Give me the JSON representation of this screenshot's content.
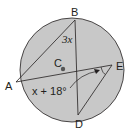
{
  "diagram": {
    "circle": {
      "cx": 72,
      "cy": 70,
      "r": 52,
      "fill": "#c8c8c8",
      "stroke": "#231f20"
    },
    "points": {
      "A": {
        "x": 16,
        "y": 82,
        "label": "A"
      },
      "B": {
        "x": 75,
        "y": 20,
        "label": "B"
      },
      "E": {
        "x": 112,
        "y": 65,
        "label": "E"
      },
      "D": {
        "x": 78,
        "y": 115,
        "label": "D"
      },
      "C": {
        "x": 63,
        "y": 69,
        "label": "C"
      }
    },
    "angle_labels": {
      "angle_b": "3x",
      "angle_e": "x + 18°"
    }
  }
}
